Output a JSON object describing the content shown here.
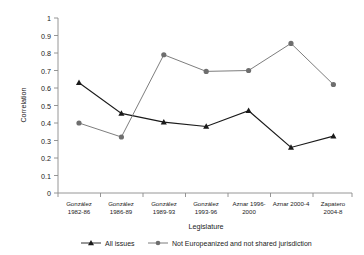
{
  "chart_data": {
    "type": "line",
    "title": "",
    "xlabel": "Legislature",
    "ylabel": "Correlation",
    "categories": [
      "González 1982-86",
      "González 1986-89",
      "González 1989-93",
      "González 1993-96",
      "Aznar 1996-2000",
      "Aznar 2000-4",
      "Zapatero 2004-8"
    ],
    "category_lines": [
      [
        "González",
        "1982-86"
      ],
      [
        "González",
        "1986-89"
      ],
      [
        "González",
        "1989-93"
      ],
      [
        "González",
        "1993-96"
      ],
      [
        "Aznar 1996-",
        "2000"
      ],
      [
        "Aznar 2000-4",
        ""
      ],
      [
        "Zapatero",
        "2004-8"
      ]
    ],
    "series": [
      {
        "name": "All issues",
        "marker": "triangle",
        "color": "#1a1a1a",
        "values": [
          0.63,
          0.455,
          0.405,
          0.38,
          0.47,
          0.26,
          0.325
        ]
      },
      {
        "name": "Not Europeanized and not shared jurisdiction",
        "marker": "circle",
        "color": "#6e6e6e",
        "values": [
          0.4,
          0.32,
          0.79,
          0.695,
          0.7,
          0.855,
          0.62
        ]
      }
    ],
    "ylim": [
      0,
      1
    ],
    "ytick_values": [
      0,
      0.1,
      0.2,
      0.3,
      0.4,
      0.5,
      0.6,
      0.7,
      0.8,
      0.9,
      1
    ],
    "ytick_labels": [
      "0",
      "0.1",
      "0.2",
      "0.3",
      "0.4",
      "0.5",
      "0.6",
      "0.7",
      "0.8",
      "0.9",
      "1"
    ],
    "grid": false,
    "legend_position": "bottom"
  },
  "legend": {
    "entries": [
      {
        "label": "All issues"
      },
      {
        "label": "Not Europeanized and not shared jurisdiction"
      }
    ]
  },
  "axes": {
    "y_title": "Correlation",
    "x_title": "Legislature"
  }
}
